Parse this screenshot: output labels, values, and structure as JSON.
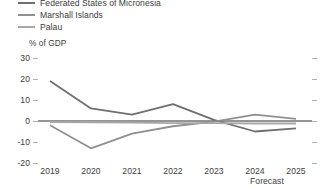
{
  "legend": {
    "items": [
      {
        "label": "Federated States of Micronesia",
        "color": "#6f6f6f",
        "swatch_icon": "line-swatch"
      },
      {
        "label": "Marshall Islands",
        "color": "#909090",
        "swatch_icon": "line-swatch"
      },
      {
        "label": "Palau",
        "color": "#a8a8a8",
        "swatch_icon": "line-swatch"
      }
    ]
  },
  "axis": {
    "y_title": "% of GDP",
    "forecast_label": "Forecast"
  },
  "chart_data": {
    "type": "line",
    "title": "",
    "subtitle": "",
    "xlabel": "",
    "ylabel": "% of GDP",
    "ylim": [
      -20,
      30
    ],
    "yticks": [
      30,
      20,
      10,
      0,
      -10,
      -20
    ],
    "x": [
      "2019",
      "2020",
      "2021",
      "2022",
      "2023",
      "2024",
      "2025"
    ],
    "categories": [
      "2019",
      "2020",
      "2021",
      "2022",
      "2023",
      "2024",
      "2025"
    ],
    "grid": false,
    "legend_position": "top-left",
    "zero_line": true,
    "forecast_start": "2023.5",
    "forecast_shade_color": "#ebebeb",
    "series": [
      {
        "name": "Federated States of Micronesia",
        "color": "#6f6f6f",
        "values": [
          19.0,
          6.0,
          3.0,
          8.0,
          0.5,
          -5.0,
          -3.5
        ]
      },
      {
        "name": "Marshall Islands",
        "color": "#909090",
        "values": [
          -2.0,
          -13.0,
          -6.0,
          -2.5,
          -0.3,
          3.0,
          1.0
        ]
      },
      {
        "name": "Palau",
        "color": "#a8a8a8",
        "values": [
          -0.5,
          -0.6,
          -0.8,
          -1.0,
          -1.0,
          -1.2,
          -1.2
        ]
      }
    ]
  }
}
